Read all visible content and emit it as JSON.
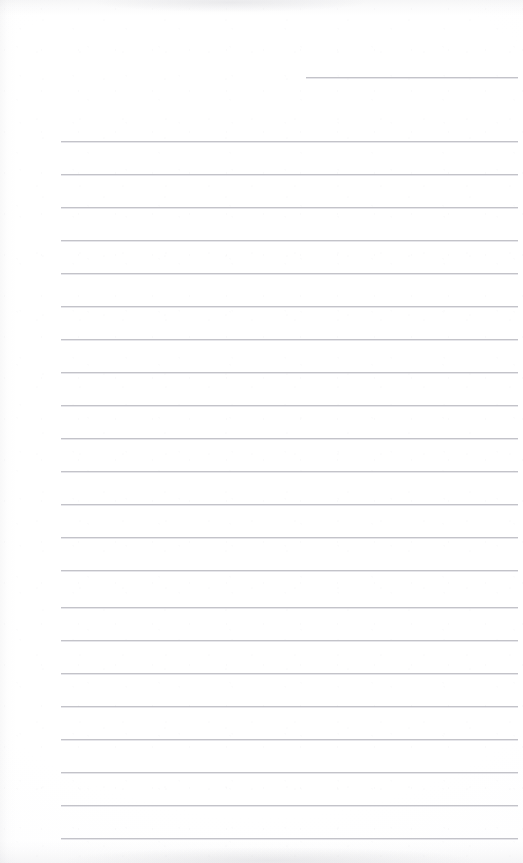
{
  "document": {
    "kind": "scanned-ruled-notepad-page",
    "page_width": 523,
    "page_height": 863,
    "background_color": "#ffffff",
    "rule_color": "#c3c3c9",
    "written_content": "",
    "visible_text": ""
  },
  "rules": [
    {
      "id": "rule-1",
      "type": "short",
      "x": 306,
      "y": 77,
      "width": 212,
      "thickness": 1
    },
    {
      "id": "rule-2",
      "type": "full",
      "x": 61,
      "y": 141,
      "width": 457,
      "thickness": 1
    },
    {
      "id": "rule-3",
      "type": "full",
      "x": 61,
      "y": 174,
      "width": 457,
      "thickness": 1
    },
    {
      "id": "rule-4",
      "type": "full",
      "x": 61,
      "y": 207,
      "width": 457,
      "thickness": 1
    },
    {
      "id": "rule-5",
      "type": "full",
      "x": 61,
      "y": 240,
      "width": 457,
      "thickness": 1
    },
    {
      "id": "rule-6",
      "type": "full",
      "x": 61,
      "y": 273,
      "width": 457,
      "thickness": 1
    },
    {
      "id": "rule-7",
      "type": "full",
      "x": 61,
      "y": 306,
      "width": 457,
      "thickness": 1
    },
    {
      "id": "rule-8",
      "type": "full",
      "x": 61,
      "y": 339,
      "width": 457,
      "thickness": 1
    },
    {
      "id": "rule-9",
      "type": "full",
      "x": 61,
      "y": 372,
      "width": 457,
      "thickness": 1
    },
    {
      "id": "rule-10",
      "type": "full",
      "x": 61,
      "y": 405,
      "width": 457,
      "thickness": 1
    },
    {
      "id": "rule-11",
      "type": "full",
      "x": 61,
      "y": 438,
      "width": 457,
      "thickness": 1
    },
    {
      "id": "rule-12",
      "type": "full",
      "x": 61,
      "y": 471,
      "width": 457,
      "thickness": 1
    },
    {
      "id": "rule-13",
      "type": "full",
      "x": 61,
      "y": 504,
      "width": 457,
      "thickness": 1
    },
    {
      "id": "rule-14",
      "type": "full",
      "x": 61,
      "y": 537,
      "width": 457,
      "thickness": 1
    },
    {
      "id": "rule-15",
      "type": "full",
      "x": 61,
      "y": 570,
      "width": 457,
      "thickness": 1
    },
    {
      "id": "rule-16",
      "type": "full",
      "x": 61,
      "y": 607,
      "width": 457,
      "thickness": 1
    },
    {
      "id": "rule-17",
      "type": "full",
      "x": 61,
      "y": 640,
      "width": 457,
      "thickness": 1
    },
    {
      "id": "rule-18",
      "type": "full",
      "x": 61,
      "y": 673,
      "width": 457,
      "thickness": 1
    },
    {
      "id": "rule-19",
      "type": "full",
      "x": 61,
      "y": 706,
      "width": 457,
      "thickness": 1
    },
    {
      "id": "rule-20",
      "type": "full",
      "x": 61,
      "y": 739,
      "width": 457,
      "thickness": 1
    },
    {
      "id": "rule-21",
      "type": "full",
      "x": 61,
      "y": 772,
      "width": 457,
      "thickness": 1
    },
    {
      "id": "rule-22",
      "type": "full",
      "x": 61,
      "y": 805,
      "width": 457,
      "thickness": 1
    },
    {
      "id": "rule-23",
      "type": "full",
      "x": 61,
      "y": 838,
      "width": 457,
      "thickness": 1
    }
  ],
  "artifacts": [
    {
      "id": "top-smudge",
      "label": "scan-smudge-top",
      "edge": "top"
    },
    {
      "id": "bottom-smudge",
      "label": "scan-smudge-bottom",
      "edge": "bottom"
    },
    {
      "id": "left-shadow",
      "label": "scan-shadow-left",
      "edge": "left"
    }
  ]
}
